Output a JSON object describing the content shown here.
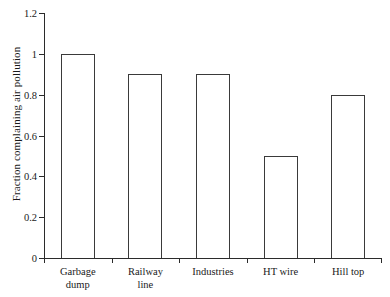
{
  "chart_data": {
    "type": "bar",
    "title": "",
    "xlabel": "",
    "ylabel": "Fraction complaining air pollution",
    "categories": [
      "Garbage dump",
      "Railway line",
      "Industries",
      "HT wire",
      "Hill top"
    ],
    "category_lines": [
      [
        "Garbage",
        "dump"
      ],
      [
        "Railway",
        "line"
      ],
      [
        "Industries"
      ],
      [
        "HT wire"
      ],
      [
        "Hill top"
      ]
    ],
    "values": [
      1,
      0.9,
      0.9,
      0.5,
      0.8
    ],
    "ylim": [
      0,
      1.2
    ],
    "ytick_values": [
      0,
      0.2,
      0.4,
      0.6,
      0.8,
      1,
      1.2
    ],
    "ytick_labels": [
      "0",
      "0.2",
      "0.4",
      "0.6",
      "0.8",
      "1",
      "1.2"
    ],
    "grid": false,
    "legend": null,
    "bar_fill": "#ffffff",
    "bar_edge": "#3a3a3a",
    "axis_color": "#2b2b2b"
  }
}
